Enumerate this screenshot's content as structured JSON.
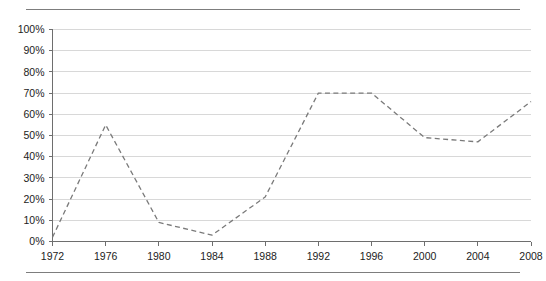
{
  "page": {
    "top_caption": "",
    "background_color": "#ffffff"
  },
  "chart_data": {
    "type": "line",
    "title": "",
    "subtitle": "",
    "xlabel": "",
    "ylabel": "",
    "categories": [
      "1972",
      "1976",
      "1980",
      "1984",
      "1988",
      "1992",
      "1996",
      "2000",
      "2004",
      "2008"
    ],
    "x": [
      1972,
      1976,
      1980,
      1984,
      1988,
      1992,
      1996,
      2000,
      2004,
      2008
    ],
    "values": [
      2,
      55,
      9,
      3,
      21,
      70,
      70,
      49,
      47,
      66
    ],
    "value_suffix": "%",
    "series": [
      {
        "name": "",
        "values": [
          2,
          55,
          9,
          3,
          21,
          70,
          70,
          49,
          47,
          66
        ],
        "line_style": "dashed",
        "color": "#7a7a7a",
        "markers": false
      }
    ],
    "ylim": [
      0,
      100
    ],
    "ytick_values": [
      0,
      10,
      20,
      30,
      40,
      50,
      60,
      70,
      80,
      90,
      100
    ],
    "ytick_labels": [
      "0%",
      "10%",
      "20%",
      "30%",
      "40%",
      "50%",
      "60%",
      "70%",
      "80%",
      "90%",
      "100%"
    ],
    "xtick_labels": [
      "1972",
      "1976",
      "1980",
      "1984",
      "1988",
      "1992",
      "1996",
      "2000",
      "2004",
      "2008"
    ],
    "xlim": [
      1972,
      2008
    ],
    "grid": {
      "horizontal": true,
      "vertical": false,
      "color": "#d8d8d8"
    },
    "legend": {
      "visible": false,
      "position": "none",
      "entries": []
    },
    "axis_color": "#6e6e6e"
  }
}
